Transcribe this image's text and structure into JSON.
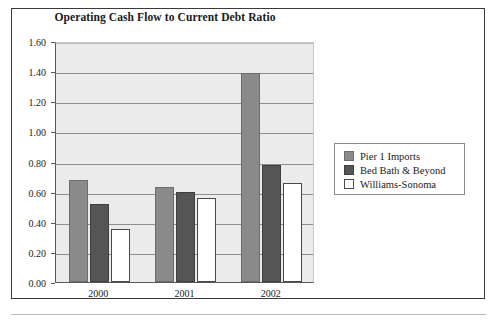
{
  "figure": {
    "title": "Operating Cash Flow to Current Debt Ratio"
  },
  "chart_data": {
    "type": "bar",
    "title": "Operating Cash Flow to Current Debt Ratio",
    "xlabel": "",
    "ylabel": "",
    "categories": [
      "2000",
      "2001",
      "2002"
    ],
    "series": [
      {
        "name": "Pier 1 Imports",
        "color": "#8a8a8a",
        "values": [
          0.68,
          0.63,
          1.39
        ]
      },
      {
        "name": "Bed Bath & Beyond",
        "color": "#555555",
        "values": [
          0.52,
          0.6,
          0.78
        ]
      },
      {
        "name": "Williams-Sonoma",
        "color": "#ffffff",
        "values": [
          0.35,
          0.56,
          0.66
        ]
      }
    ],
    "ylim": [
      0.0,
      1.6
    ],
    "ytick_values": [
      0.0,
      0.2,
      0.4,
      0.6,
      0.8,
      1.0,
      1.2,
      1.4,
      1.6
    ],
    "ytick_labels": [
      "0.00",
      "0.20",
      "0.40",
      "0.60",
      "0.80",
      "1.00",
      "1.20",
      "1.40",
      "1.60"
    ],
    "grid": true,
    "grid_axis": "y",
    "legend_position": "right",
    "legend_entries": [
      "Pier 1 Imports",
      "Bed Bath & Beyond",
      "Williams-Sonoma"
    ],
    "plot_background": "#ebebeb"
  }
}
